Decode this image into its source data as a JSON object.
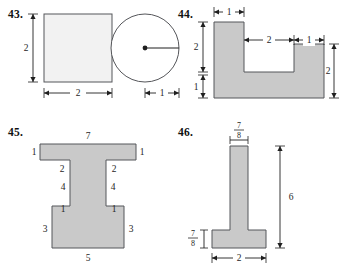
{
  "page": {
    "background_color": "#ffffff",
    "shape_fill_gray": "#c9c9c9",
    "shape_fill_light": "#f2f2f2",
    "stroke_color": "#55565a",
    "dimension_color": "#1f1f1f"
  },
  "figures": [
    {
      "id": "43",
      "number_label": "43.",
      "shapes": [
        {
          "name": "square",
          "fill": "light"
        },
        {
          "name": "circle",
          "fill": "white"
        }
      ],
      "dimensions": {
        "square_height": "2",
        "square_width": "2",
        "circle_radius": "1"
      }
    },
    {
      "id": "44",
      "number_label": "44.",
      "shapes": [
        {
          "name": "u-shape-polygon",
          "fill": "gray"
        }
      ],
      "dimensions": {
        "left_leg_width": "1",
        "left_leg_upper_height": "2",
        "base_height": "1",
        "notch_width": "2",
        "right_leg_width": "1",
        "right_leg_height": "2"
      }
    },
    {
      "id": "45",
      "number_label": "45.",
      "shapes": [
        {
          "name": "i-beam-polygon",
          "fill": "gray"
        }
      ],
      "dimensions": {
        "top_width": "7",
        "top_left_thickness": "1",
        "top_right_thickness": "1",
        "shoulder_left": "2",
        "shoulder_right": "2",
        "stem_left_height": "4",
        "stem_right_height": "4",
        "lower_shoulder_left": "1",
        "lower_shoulder_right": "1",
        "base_left_height": "3",
        "base_right_height": "3",
        "base_width": "5"
      }
    },
    {
      "id": "46",
      "number_label": "46.",
      "shapes": [
        {
          "name": "inverted-t-polygon",
          "fill": "gray"
        }
      ],
      "dimensions": {
        "stem_width_numerator": "7",
        "stem_width_denominator": "8",
        "total_height": "6",
        "base_thickness_numerator": "7",
        "base_thickness_denominator": "8",
        "base_width": "2"
      }
    }
  ]
}
